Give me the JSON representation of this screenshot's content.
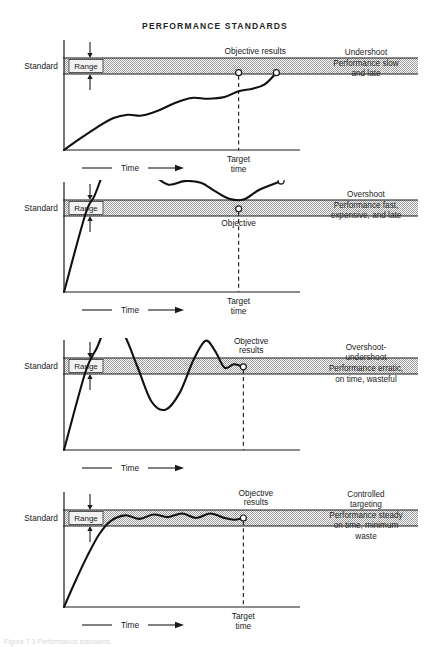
{
  "figure": {
    "title": "PERFORMANCE STANDARDS",
    "bottom_caption": "Figure 7.3 Performance standards."
  },
  "labels": {
    "standard": "Standard",
    "range": "Range",
    "time": "Time",
    "target_time_line1": "Target",
    "target_time_line2": "time",
    "objective_results": "Objective results",
    "objective_line1": "Objective",
    "objective_line2": "results",
    "objective": "Objective",
    "results": "Results"
  },
  "colors": {
    "ink": "#1a1a1a",
    "band_fill": "#d0d0d0",
    "band_stroke": "#1a1a1a",
    "axis": "#1a1a1a",
    "curve": "#111111",
    "marker_fill": "#ffffff"
  },
  "chart_data": {
    "type": "line",
    "title": "PERFORMANCE STANDARDS",
    "xlabel": "Time",
    "ylabel": "Standard",
    "grid": false,
    "legend": "none",
    "shared": {
      "band_label": "Range",
      "band_meaning": "acceptable tolerance band around the Standard",
      "x_axis_label": "Time",
      "target_time_label": "Target time"
    },
    "panels": [
      {
        "id": "undershoot",
        "index": 1,
        "note_lines": [
          "Undershoot",
          "Performance slow",
          "and late"
        ],
        "band_top": 1.08,
        "band_bottom": 0.92,
        "target_time_x": 0.74,
        "x_axis_label": "Time",
        "target_time_shown": true,
        "annotations": [
          {
            "text": "Objective results",
            "x": 0.7,
            "y": 1.18
          },
          {
            "text": "Target time",
            "x": 0.74,
            "y": -0.18
          }
        ],
        "markers": [
          {
            "name": "objective-at-target-time",
            "x": 0.74,
            "y": 0.92
          },
          {
            "name": "results-endpoint",
            "x": 0.9,
            "y": 0.92
          }
        ],
        "series": [
          {
            "name": "performance",
            "x": [
              0.0,
              0.06,
              0.14,
              0.21,
              0.27,
              0.33,
              0.4,
              0.47,
              0.54,
              0.61,
              0.68,
              0.74,
              0.8,
              0.85,
              0.9
            ],
            "y": [
              0.0,
              0.12,
              0.27,
              0.38,
              0.42,
              0.41,
              0.47,
              0.56,
              0.62,
              0.61,
              0.63,
              0.7,
              0.73,
              0.78,
              0.92
            ]
          }
        ]
      },
      {
        "id": "overshoot",
        "index": 2,
        "note_lines": [
          "Overshoot",
          "Performance fast,",
          "expensive, and late"
        ],
        "band_top": 1.08,
        "band_bottom": 0.92,
        "target_time_x": 0.74,
        "x_axis_label": "Time",
        "target_time_shown": true,
        "annotations": [
          {
            "text": "Results",
            "x": 0.9,
            "y": 1.45
          },
          {
            "text": "Objective",
            "x": 0.74,
            "y": 0.8
          },
          {
            "text": "Target time",
            "x": 0.74,
            "y": -0.18
          }
        ],
        "markers": [
          {
            "name": "objective-in-band",
            "x": 0.74,
            "y": 0.99
          },
          {
            "name": "results-endpoint",
            "x": 0.92,
            "y": 1.32
          }
        ],
        "series": [
          {
            "name": "performance",
            "x": [
              0.0,
              0.09,
              0.13,
              0.18,
              0.24,
              0.3,
              0.37,
              0.44,
              0.51,
              0.58,
              0.64,
              0.7,
              0.76,
              0.83,
              0.92
            ],
            "y": [
              0.0,
              0.92,
              1.15,
              1.5,
              1.7,
              1.62,
              1.42,
              1.28,
              1.32,
              1.3,
              1.2,
              1.11,
              1.1,
              1.22,
              1.32
            ]
          }
        ]
      },
      {
        "id": "overshoot-undershoot",
        "index": 3,
        "note_lines": [
          "Overshoot-",
          "undershoot",
          "Performance erratic,",
          "on time, wasteful"
        ],
        "band_top": 1.08,
        "band_bottom": 0.92,
        "target_time_x": 0.76,
        "x_axis_label": "Time",
        "target_time_shown": false,
        "annotations": [
          {
            "text": "Objective results",
            "x": 0.7,
            "y": 1.45
          }
        ],
        "markers": [
          {
            "name": "objective-results-endpoint",
            "x": 0.76,
            "y": 0.99
          }
        ],
        "series": [
          {
            "name": "performance",
            "x": [
              0.0,
              0.09,
              0.14,
              0.19,
              0.25,
              0.31,
              0.37,
              0.43,
              0.49,
              0.55,
              0.6,
              0.64,
              0.68,
              0.72,
              0.76
            ],
            "y": [
              0.0,
              0.92,
              1.22,
              1.52,
              1.4,
              1.0,
              0.58,
              0.48,
              0.68,
              1.08,
              1.3,
              1.18,
              0.98,
              1.02,
              0.99
            ]
          }
        ]
      },
      {
        "id": "controlled-targeting",
        "index": 4,
        "note_lines": [
          "Controlled",
          "targeting",
          "Performance steady",
          "on time, minimum",
          "waste"
        ],
        "band_top": 1.08,
        "band_bottom": 0.92,
        "target_time_x": 0.76,
        "x_axis_label": "Time",
        "target_time_shown": true,
        "annotations": [
          {
            "text": "Objective results",
            "x": 0.72,
            "y": 1.4
          },
          {
            "text": "Target time",
            "x": 0.76,
            "y": -0.18
          }
        ],
        "markers": [
          {
            "name": "objective-results-endpoint",
            "x": 0.76,
            "y": 1.0
          }
        ],
        "series": [
          {
            "name": "performance",
            "x": [
              0.0,
              0.05,
              0.1,
              0.15,
              0.2,
              0.26,
              0.32,
              0.38,
              0.44,
              0.5,
              0.56,
              0.62,
              0.68,
              0.72,
              0.76
            ],
            "y": [
              0.0,
              0.3,
              0.58,
              0.82,
              0.97,
              1.03,
              0.99,
              1.04,
              1.01,
              1.05,
              1.0,
              1.05,
              1.0,
              0.98,
              1.0
            ]
          }
        ]
      }
    ]
  }
}
